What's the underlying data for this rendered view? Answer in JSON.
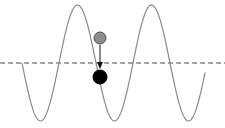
{
  "figure": {
    "title": "",
    "width": 225,
    "height": 128,
    "background_color": "#ffffff"
  },
  "chart_data": {
    "type": "line",
    "title": "",
    "subtitle": "",
    "xlabel": "",
    "ylabel": "",
    "xlim": [
      0,
      225
    ],
    "ylim": [
      0,
      128
    ],
    "grid": false,
    "legend": null,
    "axes_visible": false,
    "tick_labels": [],
    "series": [
      {
        "name": "sine-wave",
        "color": "#8a8a8a",
        "line_width": 1.2,
        "style": "solid",
        "description": "continuous sinusoid, about 2.6 cycles, amplitude 58 px about the equilibrium line",
        "amplitude": 58,
        "period": 74,
        "phase": "starts at equilibrium descending",
        "x_start": 22,
        "x_end": 205,
        "baseline_y": 63,
        "key_points": [
          {
            "label": "start",
            "x": 22,
            "y": 63
          },
          {
            "label": "trough-1",
            "x": 44,
            "y": 121
          },
          {
            "label": "zero-crossing-1",
            "x": 60,
            "y": 63
          },
          {
            "label": "peak-1",
            "x": 76,
            "y": 8
          },
          {
            "label": "zero-crossing-2",
            "x": 97,
            "y": 63
          },
          {
            "label": "trough-2",
            "x": 118,
            "y": 121
          },
          {
            "label": "zero-crossing-3",
            "x": 135,
            "y": 63
          },
          {
            "label": "peak-2",
            "x": 152,
            "y": 8
          },
          {
            "label": "zero-crossing-4",
            "x": 170,
            "y": 63
          },
          {
            "label": "trough-3",
            "x": 188,
            "y": 121
          },
          {
            "label": "end",
            "x": 205,
            "y": 60
          }
        ]
      },
      {
        "name": "equilibrium-line",
        "color": "#4a4a4a",
        "line_width": 1.2,
        "style": "dashed",
        "dash_pattern": "5 3",
        "y": 63,
        "x_start": 0,
        "x_end": 225
      }
    ],
    "markers": [
      {
        "name": "gray-particle",
        "shape": "circle",
        "x": 100,
        "y": 38,
        "radius": 6,
        "fill": "#8c8c8c",
        "stroke": "#4d4d4d",
        "stroke_width": 1,
        "label": ""
      },
      {
        "name": "black-particle",
        "shape": "circle",
        "x": 100,
        "y": 77,
        "radius": 7,
        "fill": "#000000",
        "stroke": "#000000",
        "stroke_width": 1,
        "label": ""
      }
    ],
    "annotations": [
      {
        "name": "displacement-arrow",
        "type": "arrow",
        "direction": "down",
        "x": 100,
        "y_start": 45,
        "y_end": 68,
        "color": "#111111",
        "line_width": 1,
        "head_width": 6,
        "head_length": 6,
        "text": ""
      }
    ]
  }
}
